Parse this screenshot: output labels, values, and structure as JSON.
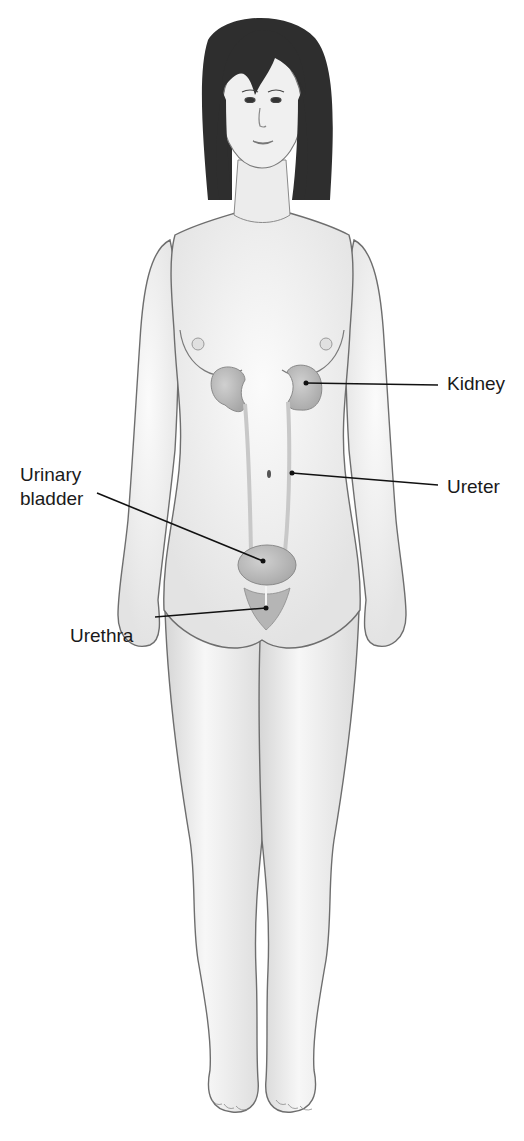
{
  "figure": {
    "background": "#ffffff",
    "colors": {
      "skin_fill": "#f2f2f2",
      "skin_shade": "#d9d9d9",
      "outline": "#6e6e6e",
      "hair": "#2e2e2e",
      "organ_fill": "#bdbdbd",
      "organ_stroke": "#8a8a8a",
      "leader_line": "#111111",
      "label_text": "#1a1a1a"
    }
  },
  "labels": [
    {
      "id": "kidney",
      "text": "Kidney",
      "x": 447,
      "y": 372,
      "anchor": {
        "x": 306,
        "y": 383
      },
      "line_start": {
        "x": 438,
        "y": 385
      }
    },
    {
      "id": "ureter",
      "text": "Ureter",
      "x": 447,
      "y": 475,
      "anchor": {
        "x": 292,
        "y": 473
      },
      "line_start": {
        "x": 438,
        "y": 485
      }
    },
    {
      "id": "urinary-bladder",
      "text": "Urinary bladder",
      "lines": [
        "Urinary",
        "bladder"
      ],
      "x": 20,
      "y": 463,
      "anchor": {
        "x": 263,
        "y": 561
      },
      "line_start": {
        "x": 97,
        "y": 493
      }
    },
    {
      "id": "urethra",
      "text": "Urethra",
      "x": 70,
      "y": 624,
      "anchor": {
        "x": 266,
        "y": 608
      },
      "line_start": {
        "x": 155,
        "y": 617
      }
    }
  ]
}
